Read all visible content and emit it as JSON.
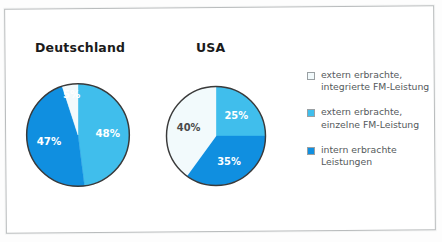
{
  "figure": {
    "background_color": "#ffffff",
    "frame_color": "#b9bcbd"
  },
  "colors": {
    "light_blue": "#40beec",
    "dark_blue": "#108fe0",
    "off_white": "#f2fafc",
    "outline": "#3a3a3a",
    "label_dark": "#4a4a4a",
    "label_light": "#ffffff",
    "legend_text": "#555a5c"
  },
  "charts": [
    {
      "id": "deutschland",
      "title": "Deutschland",
      "slices": [
        {
          "label": "48%",
          "value": 48,
          "color_key": "light_blue",
          "label_color": "label_light"
        },
        {
          "label": "47%",
          "value": 47,
          "color_key": "dark_blue",
          "label_color": "label_light"
        },
        {
          "label": "5%",
          "value": 5,
          "color_key": "off_white",
          "label_color": "label_light"
        }
      ]
    },
    {
      "id": "usa",
      "title": "USA",
      "slices": [
        {
          "label": "25%",
          "value": 25,
          "color_key": "light_blue",
          "label_color": "label_light"
        },
        {
          "label": "35%",
          "value": 35,
          "color_key": "dark_blue",
          "label_color": "label_light"
        },
        {
          "label": "40%",
          "value": 40,
          "color_key": "off_white",
          "label_color": "label_dark"
        }
      ]
    }
  ],
  "legend": {
    "items": [
      {
        "swatch_color_key": "off_white",
        "label": "extern erbrachte,\nintegrierte FM-Leistung"
      },
      {
        "swatch_color_key": "light_blue",
        "label": "extern erbrachte,\neinzelne FM-Leistung"
      },
      {
        "swatch_color_key": "dark_blue",
        "label": "intern erbrachte\nLeistungen"
      }
    ]
  },
  "chart_data": {
    "type": "pie",
    "title": "",
    "legend_position": "right",
    "grid": false,
    "categories": [
      "extern erbrachte, integrierte FM-Leistung",
      "extern erbrachte, einzelne FM-Leistung",
      "intern erbrachte Leistungen"
    ],
    "series": [
      {
        "name": "Deutschland",
        "values": [
          5,
          48,
          47
        ]
      },
      {
        "name": "USA",
        "values": [
          40,
          25,
          35
        ]
      }
    ],
    "units": "percent",
    "value_labels": {
      "Deutschland": [
        "5%",
        "48%",
        "47%"
      ],
      "USA": [
        "40%",
        "25%",
        "35%"
      ]
    }
  }
}
